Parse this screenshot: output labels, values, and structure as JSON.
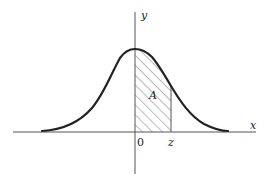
{
  "diagram": {
    "title": "",
    "type": "standard normal distribution curve with shaded area",
    "labels": {
      "y_axis": "y",
      "x_axis": "x",
      "origin": "0",
      "z_mark": "z",
      "area": "A"
    },
    "colors": {
      "background": "#ffffff",
      "stroke": "#222222",
      "axis": "#555555",
      "hatch": "#555555"
    },
    "shaded_region": {
      "from": "0",
      "to": "z",
      "pattern": "diagonal hatching"
    }
  }
}
